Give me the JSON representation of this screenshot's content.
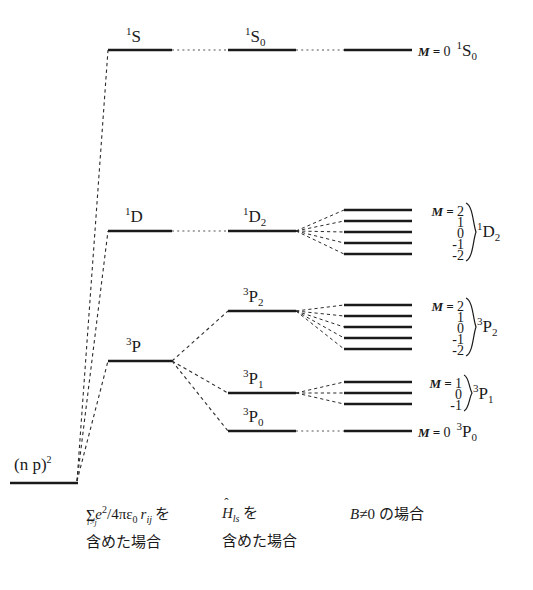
{
  "figure": {
    "type": "energy-level-diagram",
    "title": "",
    "background": "#ffffff",
    "line_color": "#1a1a1a"
  },
  "ground": {
    "label_config": "(n p)",
    "label_exponent": "2",
    "x1": 10,
    "x2": 78,
    "y": 483
  },
  "columns": {
    "term_x1": 108,
    "term_x2": 172,
    "fine_x1": 228,
    "fine_x2": 296,
    "zeeman_x1": 344,
    "zeeman_x2": 412
  },
  "terms": [
    {
      "name": "1S",
      "pre": "1",
      "letter": "S",
      "sub": "",
      "y": 50,
      "label_x": 126,
      "label_y": 26
    },
    {
      "name": "1D",
      "pre": "1",
      "letter": "D",
      "sub": "",
      "y": 231,
      "label_x": 125,
      "label_y": 206
    },
    {
      "name": "3P",
      "pre": "3",
      "letter": "P",
      "sub": "",
      "y": 361,
      "label_x": 126,
      "label_y": 336
    }
  ],
  "fine_levels": [
    {
      "name": "1S0",
      "pre": "1",
      "letter": "S",
      "sub": "0",
      "y": 50,
      "label_x": 245,
      "label_y": 26,
      "parent": "1S"
    },
    {
      "name": "1D2",
      "pre": "1",
      "letter": "D",
      "sub": "2",
      "y": 231,
      "label_x": 243,
      "label_y": 206,
      "parent": "1D"
    },
    {
      "name": "3P2",
      "pre": "3",
      "letter": "P",
      "sub": "2",
      "y": 311,
      "label_x": 243,
      "label_y": 286,
      "parent": "3P"
    },
    {
      "name": "3P1",
      "pre": "3",
      "letter": "P",
      "sub": "1",
      "y": 393,
      "label_x": 243,
      "label_y": 368,
      "parent": "3P"
    },
    {
      "name": "3P0",
      "pre": "3",
      "letter": "P",
      "sub": "0",
      "y": 431,
      "label_x": 243,
      "label_y": 406,
      "parent": "3P"
    }
  ],
  "zeeman_groups": [
    {
      "parent": "1S0",
      "term": {
        "pre": "1",
        "letter": "S",
        "sub": "0"
      },
      "inline_label": true,
      "m_prefix": "M = ",
      "m_values": [
        "0"
      ],
      "levels_y": [
        50
      ],
      "label_x": 418,
      "label_y": 42
    },
    {
      "parent": "1D2",
      "term": {
        "pre": "1",
        "letter": "D",
        "sub": "2"
      },
      "inline_label": false,
      "m_prefix": "M = ",
      "m_values": [
        "2",
        "1",
        "0",
        "-1",
        "-2"
      ],
      "levels_y": [
        210,
        221,
        232,
        243,
        254
      ],
      "brace_x": 466,
      "brace_y": 204,
      "brace_h": 56,
      "mcol_right": 464,
      "mcol_top": 203,
      "term_x": 474,
      "term_y": 221
    },
    {
      "parent": "3P2",
      "term": {
        "pre": "3",
        "letter": "P",
        "sub": "2"
      },
      "inline_label": false,
      "m_prefix": "M = ",
      "m_values": [
        "2",
        "1",
        "0",
        "-1",
        "-2"
      ],
      "levels_y": [
        305,
        316,
        327,
        338,
        349
      ],
      "brace_x": 466,
      "brace_y": 299,
      "brace_h": 56,
      "mcol_right": 464,
      "mcol_top": 298,
      "term_x": 474,
      "term_y": 316
    },
    {
      "parent": "3P1",
      "term": {
        "pre": "3",
        "letter": "P",
        "sub": "1"
      },
      "inline_label": false,
      "m_prefix": "M = ",
      "m_values": [
        "1",
        "0",
        "-1"
      ],
      "levels_y": [
        382,
        393,
        404
      ],
      "brace_x": 463,
      "brace_y": 376,
      "brace_h": 34,
      "mcol_right": 461,
      "mcol_top": 375,
      "term_x": 471,
      "term_y": 383
    },
    {
      "parent": "3P0",
      "term": {
        "pre": "3",
        "letter": "P",
        "sub": "0"
      },
      "inline_label": true,
      "m_prefix": "M = ",
      "m_values": [
        "0"
      ],
      "levels_y": [
        431
      ],
      "label_x": 418,
      "label_y": 423
    }
  ],
  "captions": [
    {
      "name": "coulomb-caption",
      "x": 86,
      "y": 505,
      "line1_math": "Σ e²/4πε₀ r_ij を",
      "sum_sub": "i>j",
      "e": "e",
      "e_exp": "2",
      "frac": "/4",
      "pi": "π",
      "eps": "ε",
      "eps_sub": "0",
      "r": "r",
      "r_sub": "ij",
      "wo": "を",
      "line2": "含めた場合"
    },
    {
      "name": "spin-orbit-caption",
      "x": 222,
      "y": 505,
      "hat": "ˆ",
      "H": "H",
      "H_sub": "ls",
      "wo": "を",
      "line2": "含めた場合"
    },
    {
      "name": "magnetic-field-caption",
      "x": 350,
      "y": 506,
      "line1": "B≠0 の場合",
      "B": "B",
      "neq": "≠",
      "zero": "0",
      "rest": " の場合"
    }
  ]
}
